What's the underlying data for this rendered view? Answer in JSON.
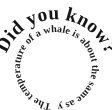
{
  "graphic": {
    "type": "circular-text-stamp",
    "background_color": "#ffffff",
    "text_color": "#161616"
  },
  "outer_ring": {
    "name": "did-you-know-arc",
    "text": "Did you know?",
    "style": "bold serif, curved along upper arc"
  },
  "inner_ring": {
    "name": "fact-circle",
    "text": "The temperature of a whale is about the same as yours.",
    "style": "bold serif, curved around full circle"
  }
}
